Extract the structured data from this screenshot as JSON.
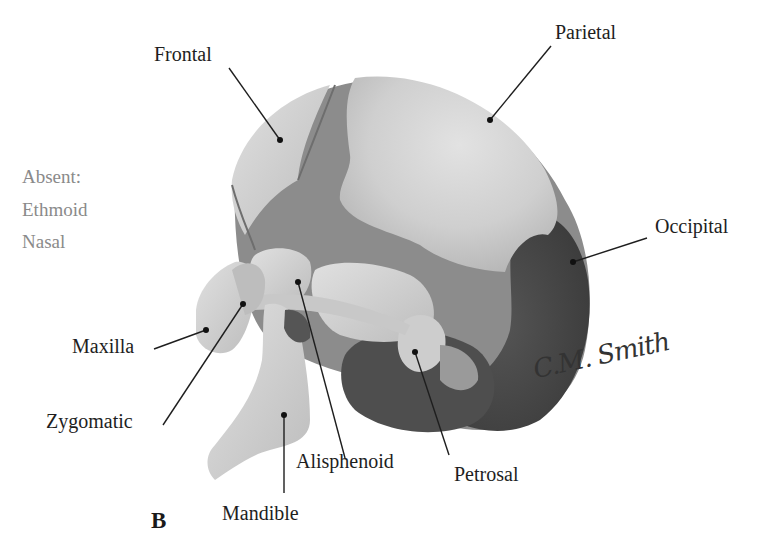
{
  "figure": {
    "panel_letter": "B",
    "absent": {
      "heading": "Absent:",
      "items": [
        "Ethmoid",
        "Nasal"
      ]
    },
    "labels": {
      "frontal": "Frontal",
      "parietal": "Parietal",
      "occipital": "Occipital",
      "maxilla": "Maxilla",
      "zygomatic": "Zygomatic",
      "alisphenoid": "Alisphenoid",
      "petrosal": "Petrosal",
      "mandible": "Mandible"
    },
    "signature": "C.M. Smith",
    "colors": {
      "bone_light": "#d4d4d4",
      "bone_mid": "#a8a8a8",
      "suture_dark": "#7a7a7a",
      "shadow": "#4a4a4a",
      "label_text": "#1e1e1e",
      "absent_text": "#8a8a8a"
    }
  }
}
